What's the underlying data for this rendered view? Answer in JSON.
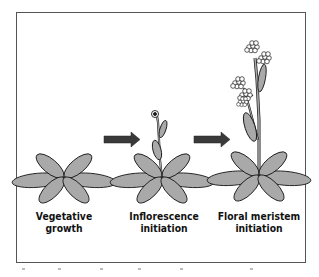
{
  "diagram": {
    "stages": [
      {
        "line1": "Vegetative",
        "line2": "growth"
      },
      {
        "line1": "Inflorescence",
        "line2": "initiation"
      },
      {
        "line1": "Floral meristem",
        "line2": "initiation"
      }
    ],
    "arrows": 2,
    "colors": {
      "leaf_fill": "#a9a9a9",
      "outline": "#1a1a1a",
      "arrow": "#3a3a3a",
      "frame": "#555555"
    }
  }
}
